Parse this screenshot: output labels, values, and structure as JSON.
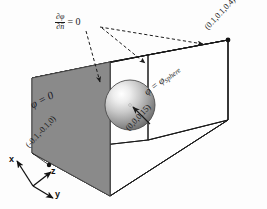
{
  "figure": {
    "background_color": "#fdfdfd",
    "line_color": "#1b1b1b",
    "shaded_face_color": "#8a8a8a"
  },
  "labels": {
    "neumann": {
      "numerator": "∂φ",
      "denominator": "∂n̂",
      "equals_zero": "= 0",
      "full_text": "∂φ/∂n̂ = 0"
    },
    "dirichlet_wall": "φ = 0",
    "sphere_boundary": {
      "lhs": "φ = φ",
      "subscript": "sphere",
      "full_text": "φ = φsphere"
    },
    "coord_max": "(0.1,0.1,0.4)",
    "coord_min": "(-0.1,-0.1,0)",
    "coord_sphere_center": "(0,0,0.15)"
  },
  "axes": {
    "x": "x",
    "y": "y",
    "z": "z"
  },
  "geometry": {
    "box_vertices_px": {
      "front_top_left": [
        32,
        78
      ],
      "front_top_right": [
        110,
        62
      ],
      "back_top_right": [
        228,
        40
      ],
      "back_top_left": [
        148,
        55
      ],
      "front_bottom_left": [
        32,
        153
      ],
      "front_bottom_right": [
        110,
        196
      ],
      "back_bottom_right": [
        228,
        120
      ],
      "back_bottom_left": [
        148,
        140
      ]
    },
    "sphere": {
      "center_px": [
        130,
        105
      ],
      "radius_px": 25
    },
    "dirichlet_face_vertices_px": [
      [
        32,
        78
      ],
      [
        110,
        62
      ],
      [
        110,
        196
      ],
      [
        32,
        153
      ]
    ]
  },
  "arrows": {
    "neumann_arrow_count": 3,
    "style": "dashed",
    "center_pointer_style": "solid"
  }
}
